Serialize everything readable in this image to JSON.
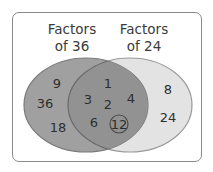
{
  "diagram": {
    "type": "venn",
    "colors": {
      "frame_border": "#8a8a8a",
      "left_set_fill": "#9e9e9e",
      "right_set_fill": "#e3e3e3",
      "overlap_fill": "#8f8f8f",
      "set_outline": "#6e6e6e",
      "text": "#2e2e2e"
    },
    "sets": [
      {
        "id": "left",
        "title_line1": "Factors",
        "title_line2": "of 36",
        "only_items": [
          "9",
          "36",
          "18"
        ]
      },
      {
        "id": "right",
        "title_line1": "Factors",
        "title_line2": "of 24",
        "only_items": [
          "8",
          "24"
        ]
      }
    ],
    "intersection_items": [
      "1",
      "3",
      "2",
      "4",
      "6",
      "12"
    ],
    "highlighted_item": "12",
    "highlight_note": "12 is circled (greatest common factor)"
  }
}
